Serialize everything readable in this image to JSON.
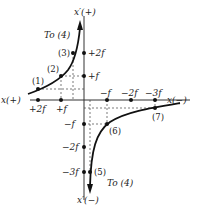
{
  "axes": {
    "vertical_top": "x′(+)",
    "vertical_bottom": "x′(−)",
    "horizontal_left": "x(+)",
    "horizontal_right": "x(−)"
  },
  "horizontal_ticks": [
    "+2f",
    "+f",
    "−f",
    "−2f",
    "−3f"
  ],
  "vertical_ticks": [
    "+2f",
    "+f",
    "−f",
    "−2f",
    "−3f"
  ],
  "points": [
    "(1)",
    "(2)",
    "(3)",
    "(5)",
    "(6)",
    "(7)"
  ],
  "annotations": {
    "upper_arrow": "To (4)",
    "lower_arrow": "To (4)"
  }
}
